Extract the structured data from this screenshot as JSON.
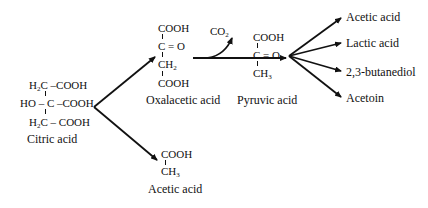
{
  "diagram": {
    "type": "metabolic-pathway",
    "citric_acid": {
      "rows": [
        "H2C –COOH",
        "HO – C –COOH",
        "H2C – COOH"
      ],
      "row1_prefix": "H",
      "row1_sub": "2",
      "row1_rest": "C –COOH",
      "row2": "HO – C –COOH",
      "row3_prefix": "H",
      "row3_sub": "2",
      "row3_rest": "C – COOH",
      "label": "Citric acid"
    },
    "oxalacetic_acid": {
      "line1": "COOH",
      "line2": "C = O",
      "line3_main": "CH",
      "line3_sub": "2",
      "line4": "COOH",
      "label": "Oxalacetic acid"
    },
    "acetic_acid_lower": {
      "line1": "COOH",
      "line2_main": "CH",
      "line2_sub": "3",
      "label": "Acetic acid"
    },
    "co2": {
      "main": "CO",
      "sub": "2"
    },
    "pyruvic_acid": {
      "line1": "COOH",
      "line2": "C = O",
      "line3_main": "CH",
      "line3_sub": "3",
      "label": "Pyruvic acid"
    },
    "products": [
      "Acetic acid",
      "Lactic acid",
      "2,3-butanediol",
      "Acetoin"
    ],
    "arrow_color": "#111111"
  }
}
